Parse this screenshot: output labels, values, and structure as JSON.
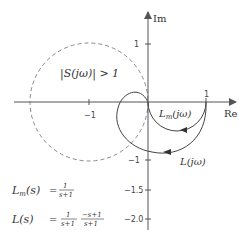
{
  "axes": {
    "x_label": "Re",
    "y_label": "Im",
    "x_ticks": [
      {
        "value": -1,
        "label": "−1"
      },
      {
        "value": 1,
        "label": "1"
      }
    ],
    "y_ticks": [
      {
        "value": 1,
        "label": "1"
      },
      {
        "value": -1,
        "label": "−1"
      },
      {
        "value": -1.5,
        "label": "−1.5"
      },
      {
        "value": -2.0,
        "label": "−2.0"
      }
    ]
  },
  "annotations": {
    "sensitivity_region": "|S(jω)| > 1",
    "lm_curve": "L",
    "lm_curve_sub": "m",
    "lm_curve_arg": "(jω)",
    "l_curve": "L(jω)"
  },
  "equations": {
    "lm": {
      "lhs": "L",
      "lhs_sub": "m",
      "lhs_arg": "(s)",
      "eq": "=",
      "num": "1",
      "den": "s+1"
    },
    "l": {
      "lhs": "L(s)",
      "eq": "=",
      "num1": "1",
      "den1": "s+1",
      "num2": "−s+1",
      "den2": "s+1"
    }
  },
  "colors": {
    "axis": "#555555",
    "curve": "#444444",
    "dashed": "#888888"
  }
}
